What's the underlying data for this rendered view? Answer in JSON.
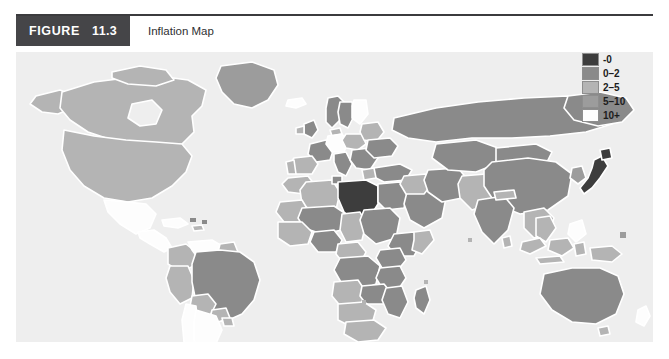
{
  "figure": {
    "tag_word": "FIGURE",
    "number": "11.3",
    "title": "Inflation Map"
  },
  "legend": {
    "items": [
      {
        "label": "-0",
        "color": "#3d3d3d"
      },
      {
        "label": "0–2",
        "color": "#8a8a8a"
      },
      {
        "label": "2–5",
        "color": "#b4b4b4"
      },
      {
        "label": "5–10",
        "color": "#9c9c9c"
      },
      {
        "label": "10+",
        "color": "#fdfdfd"
      }
    ]
  },
  "map": {
    "title": "World Inflation Map",
    "ocean_color": "#eeeeee",
    "border_color": "#ffffff",
    "panel": {
      "x": 16,
      "y": 52,
      "width": 637,
      "height": 290
    },
    "bands": {
      "deflation": "#3d3d3d",
      "low": "#8a8a8a",
      "moderate": "#b4b4b4",
      "high": "#9c9c9c",
      "very_high": "#fdfdfd"
    },
    "regions": [
      {
        "name": "Greenland",
        "band": "moderate"
      },
      {
        "name": "Canada",
        "band": "moderate"
      },
      {
        "name": "Alaska",
        "band": "moderate"
      },
      {
        "name": "United States",
        "band": "moderate"
      },
      {
        "name": "Mexico",
        "band": "very_high"
      },
      {
        "name": "Central America",
        "band": "very_high"
      },
      {
        "name": "Cuba",
        "band": "very_high"
      },
      {
        "name": "Colombia",
        "band": "moderate"
      },
      {
        "name": "Venezuela",
        "band": "very_high"
      },
      {
        "name": "Peru",
        "band": "moderate"
      },
      {
        "name": "Brazil",
        "band": "low"
      },
      {
        "name": "Bolivia",
        "band": "moderate"
      },
      {
        "name": "Chile",
        "band": "very_high"
      },
      {
        "name": "Argentina",
        "band": "very_high"
      },
      {
        "name": "Paraguay",
        "band": "moderate"
      },
      {
        "name": "Iceland",
        "band": "very_high"
      },
      {
        "name": "Norway",
        "band": "low"
      },
      {
        "name": "Sweden",
        "band": "low"
      },
      {
        "name": "Finland",
        "band": "very_high"
      },
      {
        "name": "United Kingdom",
        "band": "low"
      },
      {
        "name": "France",
        "band": "low"
      },
      {
        "name": "Spain",
        "band": "moderate"
      },
      {
        "name": "Portugal",
        "band": "moderate"
      },
      {
        "name": "Germany",
        "band": "very_high"
      },
      {
        "name": "Poland",
        "band": "moderate"
      },
      {
        "name": "Italy",
        "band": "low"
      },
      {
        "name": "Balkans",
        "band": "low"
      },
      {
        "name": "Ukraine",
        "band": "low"
      },
      {
        "name": "Belarus",
        "band": "moderate"
      },
      {
        "name": "Turkey",
        "band": "low"
      },
      {
        "name": "Morocco",
        "band": "moderate"
      },
      {
        "name": "Algeria",
        "band": "moderate"
      },
      {
        "name": "Libya",
        "band": "deflation"
      },
      {
        "name": "Egypt",
        "band": "low"
      },
      {
        "name": "Mauritania",
        "band": "moderate"
      },
      {
        "name": "Mali",
        "band": "low"
      },
      {
        "name": "Niger",
        "band": "moderate"
      },
      {
        "name": "Chad",
        "band": "moderate"
      },
      {
        "name": "Sudan",
        "band": "low"
      },
      {
        "name": "Nigeria",
        "band": "low"
      },
      {
        "name": "Ethiopia",
        "band": "low"
      },
      {
        "name": "Somalia",
        "band": "moderate"
      },
      {
        "name": "Kenya",
        "band": "low"
      },
      {
        "name": "Tanzania",
        "band": "low"
      },
      {
        "name": "DR Congo",
        "band": "low"
      },
      {
        "name": "Angola",
        "band": "moderate"
      },
      {
        "name": "Zambia",
        "band": "low"
      },
      {
        "name": "Mozambique",
        "band": "low"
      },
      {
        "name": "Madagascar",
        "band": "low"
      },
      {
        "name": "South Africa",
        "band": "moderate"
      },
      {
        "name": "Namibia",
        "band": "moderate"
      },
      {
        "name": "Saudi Arabia",
        "band": "low"
      },
      {
        "name": "Iran",
        "band": "low"
      },
      {
        "name": "Iraq",
        "band": "moderate"
      },
      {
        "name": "Kazakhstan",
        "band": "low"
      },
      {
        "name": "Russia",
        "band": "low"
      },
      {
        "name": "China",
        "band": "low"
      },
      {
        "name": "Mongolia",
        "band": "low"
      },
      {
        "name": "India",
        "band": "low"
      },
      {
        "name": "Pakistan",
        "band": "moderate"
      },
      {
        "name": "Southeast Asia",
        "band": "moderate"
      },
      {
        "name": "Indonesia",
        "band": "moderate"
      },
      {
        "name": "Japan",
        "band": "deflation"
      },
      {
        "name": "Korea",
        "band": "moderate"
      },
      {
        "name": "Philippines",
        "band": "very_high"
      },
      {
        "name": "Papua New Guinea",
        "band": "moderate"
      },
      {
        "name": "Australia",
        "band": "low"
      },
      {
        "name": "New Zealand",
        "band": "very_high"
      }
    ]
  }
}
